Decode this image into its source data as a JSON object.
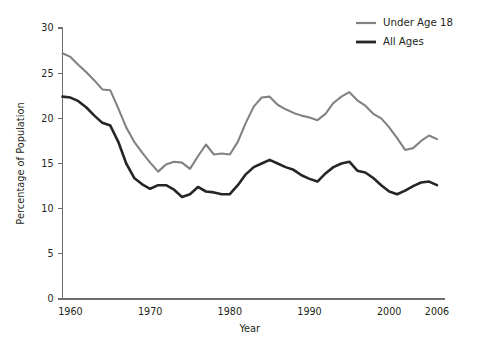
{
  "chart_data": {
    "type": "line",
    "title": "",
    "xlabel": "Year",
    "ylabel": "Percentage of Population",
    "xlim": [
      1959,
      2006
    ],
    "ylim": [
      0,
      30
    ],
    "xticks": [
      1960,
      1970,
      1980,
      1990,
      2000,
      2006
    ],
    "yticks": [
      0,
      5,
      10,
      15,
      20,
      25,
      30
    ],
    "grid": false,
    "legend_position": "top-right",
    "x": [
      1959,
      1960,
      1961,
      1962,
      1963,
      1964,
      1965,
      1966,
      1967,
      1968,
      1969,
      1970,
      1971,
      1972,
      1973,
      1974,
      1975,
      1976,
      1977,
      1978,
      1979,
      1980,
      1981,
      1982,
      1983,
      1984,
      1985,
      1986,
      1987,
      1988,
      1989,
      1990,
      1991,
      1992,
      1993,
      1994,
      1995,
      1996,
      1997,
      1998,
      1999,
      2000,
      2001,
      2002,
      2003,
      2004,
      2005,
      2006
    ],
    "series": [
      {
        "name": "Under Age 18",
        "color": "#808285",
        "values": [
          27.2,
          26.8,
          25.9,
          25.1,
          24.2,
          23.2,
          23.1,
          21.1,
          19.0,
          17.4,
          16.2,
          15.1,
          14.1,
          14.9,
          15.2,
          15.1,
          14.4,
          15.8,
          17.1,
          16.0,
          16.1,
          16.0,
          17.4,
          19.5,
          21.3,
          22.3,
          22.4,
          21.5,
          21.0,
          20.6,
          20.3,
          20.1,
          19.8,
          20.5,
          21.7,
          22.4,
          22.9,
          22.0,
          21.4,
          20.5,
          20.0,
          19.0,
          17.8,
          16.5,
          16.7,
          17.5,
          18.1,
          17.7
        ]
      },
      {
        "name": "All Ages",
        "color": "#262626",
        "values": [
          22.4,
          22.3,
          21.9,
          21.2,
          20.3,
          19.5,
          19.2,
          17.4,
          15.0,
          13.4,
          12.7,
          12.2,
          12.6,
          12.6,
          12.1,
          11.3,
          11.6,
          12.4,
          11.9,
          11.8,
          11.6,
          11.6,
          12.6,
          13.8,
          14.6,
          15.0,
          15.4,
          15.0,
          14.6,
          14.3,
          13.7,
          13.3,
          13.0,
          13.9,
          14.6,
          15.0,
          15.2,
          14.2,
          14.0,
          13.4,
          12.6,
          11.9,
          11.6,
          12.0,
          12.5,
          12.9,
          13.0,
          12.6
        ]
      }
    ]
  },
  "legend": {
    "items": [
      {
        "label": "Under Age 18",
        "color": "#808285"
      },
      {
        "label": "All Ages",
        "color": "#262626"
      }
    ]
  }
}
